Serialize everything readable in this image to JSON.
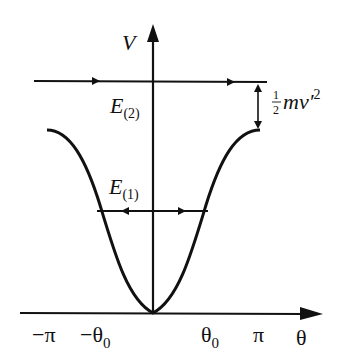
{
  "diagram": {
    "type": "potential-energy-well",
    "axes": {
      "y_label": "V",
      "x_label": "θ"
    },
    "x_ticks": [
      {
        "label": "−π",
        "sub": ""
      },
      {
        "label": "−θ",
        "sub": "0"
      },
      {
        "label": "θ",
        "sub": "0"
      },
      {
        "label": "π",
        "sub": ""
      }
    ],
    "levels": {
      "e2": {
        "label": "E",
        "sub": "(2)"
      },
      "e1": {
        "label": "E",
        "sub": "(1)"
      }
    },
    "annotation": {
      "frac_num": "1",
      "frac_den": "2",
      "text": "mv′",
      "sup": "2"
    },
    "colors": {
      "line": "#111111",
      "background": "#ffffff"
    }
  }
}
